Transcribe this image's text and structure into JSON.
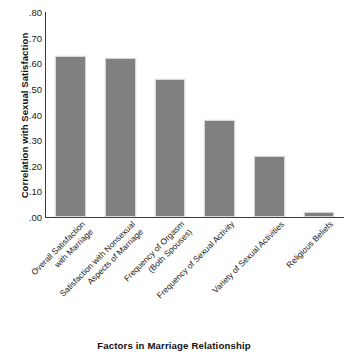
{
  "chart_data": {
    "type": "bar",
    "title": "",
    "xlabel": "Factors in Marriage Relationship",
    "ylabel": "Correlation with Sexual Satisfaction",
    "categories": [
      "Overall Satisfaction with Marriage",
      "Satisfaction with Nonsexual Aspects of Marriage",
      "Frequency of Orgasm (Both Spouses)",
      "Frequency of Sexual Activity",
      "Variety of Sexual Activities",
      "Religious Beliefs"
    ],
    "category_lines": [
      [
        "Overall Satisfaction",
        "with Marriage"
      ],
      [
        "Satisfaction with Nonsexual",
        "Aspects of Marriage"
      ],
      [
        "Frequency of Orgasm",
        "(Both Spouses)"
      ],
      [
        "Frequency of Sexual Activity"
      ],
      [
        "Variety of Sexual Activities"
      ],
      [
        "Religious Beliefs"
      ]
    ],
    "values": [
      0.63,
      0.62,
      0.54,
      0.38,
      0.24,
      0.02
    ],
    "ylim": [
      0.0,
      0.8
    ],
    "ytick_values": [
      0.8,
      0.7,
      0.6,
      0.5,
      0.4,
      0.3,
      0.2,
      0.1,
      0.0
    ],
    "ytick_labels": [
      ".80",
      ".70",
      ".60",
      ".50",
      ".40",
      ".30",
      ".20",
      ".10",
      ".00"
    ],
    "grid": false,
    "legend": false,
    "bar_color": "#808080",
    "bar_edge_color": "#d8d8d8",
    "axis_color": "#3a3a3a",
    "background": "#ffffff"
  }
}
